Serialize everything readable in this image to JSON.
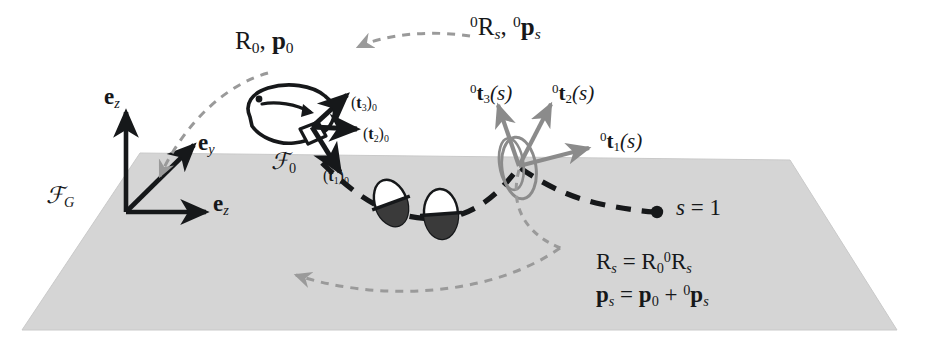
{
  "figure": {
    "background_color": "#ffffff",
    "ground_plane_color": "#d4d4d4",
    "ink_color": "#16181a",
    "gray_accent_color": "#8b8b8b"
  },
  "labels": {
    "body_frame_pose": "R₀, p₀",
    "relative_pose": "⁰Rₛ, ⁰pₛ",
    "tangent_3_s": "⁰t₃(s)",
    "tangent_2_s": "⁰t₂(s)",
    "tangent_1_s": "⁰t₁(s)",
    "tangent_3_zero": "(t₃)₀",
    "tangent_2_zero": "(t₂)₀",
    "tangent_1_zero": "(t₁)₀",
    "frame_body": "ℱ₀",
    "frame_global": "ℱ_G",
    "axis_ez_up": "e_z",
    "axis_ey": "e_y",
    "axis_ez_right": "e_z",
    "arclength_end": "s = 1",
    "equation_rotation": "Rₛ = R₀ ⁰Rₛ",
    "equation_position": "pₛ = p₀ + ⁰pₛ"
  },
  "label_parts": {
    "R0p0": {
      "r": "R",
      "r_sub": "0",
      "comma": ", ",
      "p": "p",
      "p_sub": "0"
    },
    "rel_pose": {
      "pre1": "0",
      "r": "R",
      "r_sub": "s",
      "comma": ", ",
      "pre2": "0",
      "p": "p",
      "p_sub": "s"
    },
    "t3s": {
      "pre": "0",
      "t": "t",
      "idx": "3",
      "arg": "(s)"
    },
    "t2s": {
      "pre": "0",
      "t": "t",
      "idx": "2",
      "arg": "(s)"
    },
    "t1s": {
      "pre": "0",
      "t": "t",
      "idx": "1",
      "arg": "(s)"
    },
    "t3_0": {
      "open": "(",
      "t": "t",
      "idx": "3",
      "close": ")",
      "sub": "0"
    },
    "t2_0": {
      "open": "(",
      "t": "t",
      "idx": "2",
      "close": ")",
      "sub": "0"
    },
    "t1_0": {
      "open": "(",
      "t": "t",
      "idx": "1",
      "close": ")",
      "sub": "0"
    },
    "frame0": {
      "f": "F",
      "sub": "0"
    },
    "frameG": {
      "f": "F",
      "sub": "G"
    },
    "ez_up": {
      "e": "e",
      "sub": "z"
    },
    "ey": {
      "e": "e",
      "sub": "y"
    },
    "ez_right": {
      "e": "e",
      "sub": "z"
    },
    "s_one": {
      "s": "s",
      "eq": " = ",
      "val": "1"
    },
    "eq_rot": {
      "r1": "R",
      "s1": "s",
      "eq": " = ",
      "r2": "R",
      "s2": "0",
      "pre": "0",
      "r3": "R",
      "s3": "s"
    },
    "eq_pos": {
      "p1": "p",
      "s1": "s",
      "eq": " = ",
      "p2": "p",
      "s2": "0",
      "plus": " + ",
      "pre": "0",
      "p3": "p",
      "s3": "s"
    }
  },
  "geometry": {
    "ground_plane_points": "140,153 790,160 897,330 22,330",
    "global_frame_origin": [
      126,
      212
    ],
    "global_axis_ez_up_tip": [
      126,
      110
    ],
    "global_axis_ey_tip": [
      196,
      143
    ],
    "global_axis_ez_right_tip": [
      208,
      212
    ],
    "body_frame_origin": [
      312,
      127
    ],
    "body_t3_tip": [
      350,
      93
    ],
    "body_t2_tip": [
      360,
      129
    ],
    "body_t1_tip": [
      343,
      176
    ],
    "section_frame_origin": [
      519,
      166
    ],
    "section_t3_tip": [
      496,
      101
    ],
    "section_t2_tip": [
      553,
      100
    ],
    "section_t1_tip": [
      594,
      146
    ],
    "backbone_end_point": [
      657,
      212
    ],
    "cross_sections": [
      {
        "cx": 391,
        "cy": 203,
        "rx": 16,
        "ry": 24,
        "rot": -20
      },
      {
        "cx": 441,
        "cy": 214,
        "rx": 17,
        "ry": 25,
        "rot": -4
      },
      {
        "cx": 519,
        "cy": 168,
        "rx": 17,
        "ry": 31,
        "rot": -8
      }
    ]
  },
  "icons": {
    "body": "fish-body-icon",
    "eye": "eye-dot-icon",
    "endpoint": "endpoint-dot-icon"
  }
}
